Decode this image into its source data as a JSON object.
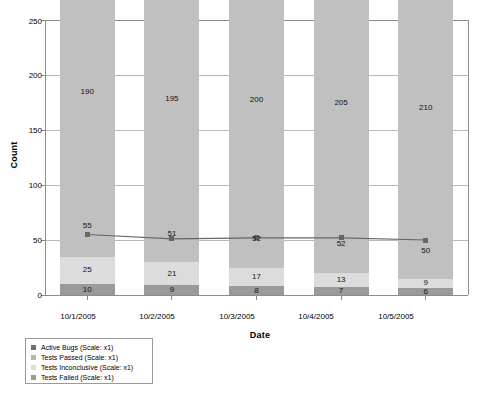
{
  "chart_data": {
    "type": "bar",
    "title": "",
    "subtitle": "",
    "xlabel": "Date",
    "ylabel": "Count",
    "ylim": [
      0,
      250
    ],
    "yticks": [
      0,
      50,
      100,
      150,
      200,
      250
    ],
    "grid": true,
    "legend_position": "bottom-left",
    "stacked": true,
    "categories": [
      "10/1/2005",
      "10/2/2005",
      "10/3/2005",
      "10/4/2005",
      "10/5/2005"
    ],
    "series": [
      {
        "name": "Tests Failed (Scale: x1)",
        "short_name": "Tests Failed",
        "kind": "bar",
        "color": "#9a9a9a",
        "values": [
          10,
          9,
          8,
          7,
          6
        ]
      },
      {
        "name": "Tests Inconclusive (Scale: x1)",
        "short_name": "Tests Inconclusive",
        "kind": "bar",
        "color": "#dcdcdc",
        "values": [
          25,
          21,
          17,
          13,
          9
        ]
      },
      {
        "name": "Tests Passed (Scale: x1)",
        "short_name": "Tests Passed",
        "kind": "bar",
        "color": "#c0c0c0",
        "values": [
          55,
          51,
          52,
          52,
          50
        ]
      },
      {
        "name": "Active Bugs (Scale: x1)",
        "short_name": "Active Bugs",
        "kind": "bar",
        "color": "#c0c0c0",
        "values": [
          190,
          195,
          200,
          205,
          210
        ]
      },
      {
        "name": "Tests Passed line overlay",
        "short_name": "Tests Passed line",
        "kind": "line",
        "color": "#666666",
        "values": [
          55,
          51,
          52,
          52,
          50
        ]
      }
    ]
  },
  "legend": {
    "items": [
      {
        "label": "Active Bugs (Scale: x1)",
        "color": "#707070"
      },
      {
        "label": "Tests Passed (Scale: x1)",
        "color": "#b4b4b4"
      },
      {
        "label": "Tests Inconclusive (Scale: x1)",
        "color": "#dcdcdc"
      },
      {
        "label": "Tests Failed (Scale: x1)",
        "color": "#9a9a9a"
      }
    ]
  },
  "axes": {
    "y_title": "Count",
    "x_title": "Date",
    "y_tick_labels": [
      "250",
      "200",
      "150",
      "100",
      "50",
      "0"
    ],
    "x_tick_labels": [
      "10/1/2005",
      "10/2/2005",
      "10/3/2005",
      "10/4/2005",
      "10/5/2005"
    ]
  },
  "bar_labels": {
    "active_bugs": [
      "190",
      "195",
      "200",
      "205",
      "210"
    ],
    "tests_passed": [
      "55",
      "51",
      "52",
      "52",
      "50"
    ],
    "tests_inconclusive": [
      "25",
      "21",
      "17",
      "13",
      "9"
    ],
    "tests_failed": [
      "10",
      "9",
      "8",
      "7",
      "6"
    ]
  },
  "colors": {
    "bar_light": "#dcdcdc",
    "bar_medium": "#c0c0c0",
    "bar_dark": "#9a9a9a",
    "line": "#666666",
    "axis": "#8c8c8c",
    "grid": "#b8b8b8",
    "text": "#000000",
    "background": "#ffffff"
  }
}
